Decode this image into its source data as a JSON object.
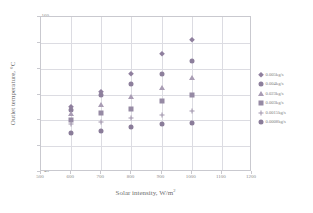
{
  "chart_data": {
    "type": "scatter",
    "title": "",
    "xlabel": "Solar intensity, W/m²",
    "ylabel": "Outlet temperature, °C",
    "xlim": [
      500,
      1200
    ],
    "ylim": [
      40,
      160
    ],
    "xticks": [
      500,
      600,
      700,
      800,
      900,
      1000,
      1100,
      1200
    ],
    "yticks": [
      40,
      60,
      80,
      100,
      120,
      140,
      160
    ],
    "grid": true,
    "legend_position": "right",
    "x": [
      600,
      700,
      800,
      900,
      1000
    ],
    "series": [
      {
        "name": "0.005kg/s",
        "marker": "diamond",
        "color": "#8f7f9e",
        "values": [
          90,
          102,
          116,
          131,
          142
        ]
      },
      {
        "name": "0.004kg/s",
        "marker": "circle",
        "color": "#8d7f9c",
        "values": [
          88,
          100,
          108,
          116,
          126
        ]
      },
      {
        "name": "0.023kg/s",
        "marker": "triangle",
        "color": "#a99cb4",
        "values": [
          85,
          92,
          98,
          105,
          113
        ]
      },
      {
        "name": "0.003kg/s",
        "marker": "square",
        "color": "#968aa4",
        "values": [
          80,
          86,
          89,
          95,
          100
        ]
      },
      {
        "name": "0.0015kg/s",
        "marker": "plus",
        "color": "#9f93ab",
        "values": [
          77,
          79,
          82,
          84,
          87
        ]
      },
      {
        "name": "0.0008kg/s",
        "marker": "circle",
        "color": "#8a7c99",
        "values": [
          70,
          72,
          75,
          77,
          78
        ]
      }
    ]
  },
  "colors": {
    "plot_border": "#c9c9cf",
    "gridline": "#dcdce2",
    "tick_text": "#8a8a8a",
    "axis_title": "#6f6f6f",
    "background": "#ffffff"
  }
}
